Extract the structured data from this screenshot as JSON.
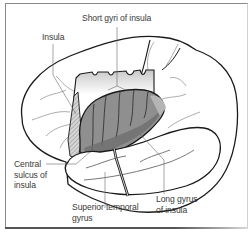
{
  "figure": {
    "type": "anatomical-diagram",
    "colors": {
      "background": "#ffffff",
      "outline": "#1a1a1a",
      "insula_fill": "#8c8c8c",
      "insula_dark": "#6e6e6e",
      "leader_line": "#6a6a6a",
      "label_text": "#3a3a3a",
      "frame": "#8a8a8a"
    }
  },
  "labels": {
    "short_gyri": "Short gyri of insula",
    "insula": "Insula",
    "central_sulcus": "Central\nsulcus of\ninsula",
    "superior_temporal": "Superior temporal\ngyrus",
    "long_gyrus": "Long gyrus\nof insula"
  }
}
